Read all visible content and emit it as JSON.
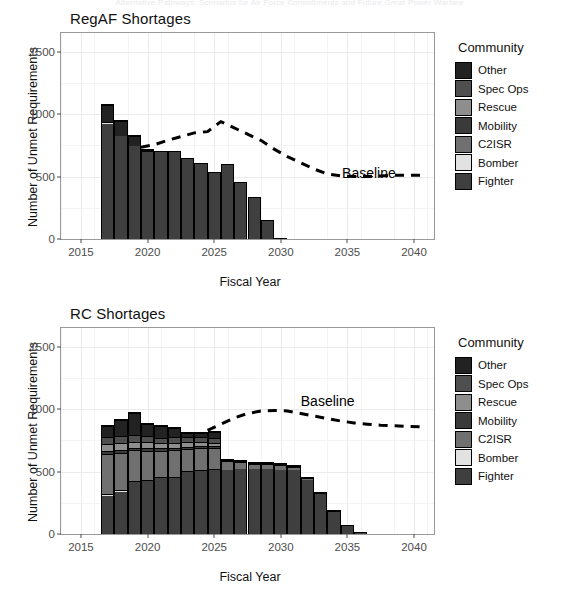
{
  "page": {
    "cut_header_text": "Alternative Pathways: Scenarios for Air Force Commitments and Future Great Power Warfare"
  },
  "legend": {
    "title": "Community",
    "items": [
      {
        "label": "Other",
        "color": "#222222"
      },
      {
        "label": "Spec Ops",
        "color": "#4f4f4f"
      },
      {
        "label": "Rescue",
        "color": "#8e8e8e"
      },
      {
        "label": "Mobility",
        "color": "#3a3a3a"
      },
      {
        "label": "C2ISR",
        "color": "#707070"
      },
      {
        "label": "Bomber",
        "color": "#e2e2e2"
      },
      {
        "label": "Fighter",
        "color": "#3f3f3f"
      }
    ]
  },
  "axes": {
    "ylabel": "Number of Unmet Requirements",
    "xlabel": "Fiscal Year",
    "yticks": [
      0,
      500,
      1000,
      1500
    ],
    "xticks": [
      2015,
      2020,
      2025,
      2030,
      2035,
      2040
    ],
    "ylim": [
      0,
      1650
    ],
    "xlim": [
      2013.5,
      2041.5
    ]
  },
  "chart_data": [
    {
      "type": "bar",
      "id": "regaf",
      "title": "RegAF Shortages",
      "xlabel": "Fiscal Year",
      "ylabel": "Number of Unmet Requirements",
      "ylim": [
        0,
        1650
      ],
      "xlim": [
        2013.5,
        2041.5
      ],
      "grid": true,
      "stacked": true,
      "legend_position": "right",
      "categories": [
        2017,
        2018,
        2019,
        2020,
        2021,
        2022,
        2023,
        2024,
        2025,
        2026,
        2027,
        2028,
        2029,
        2030
      ],
      "series": [
        {
          "name": "Fighter",
          "color": "#3f3f3f",
          "values": [
            930,
            830,
            750,
            715,
            705,
            705,
            645,
            610,
            535,
            600,
            455,
            340,
            150,
            10
          ]
        },
        {
          "name": "Bomber",
          "color": "#e2e2e2",
          "values": [
            15,
            0,
            0,
            0,
            0,
            0,
            0,
            0,
            0,
            0,
            0,
            0,
            0,
            0
          ]
        },
        {
          "name": "C2ISR",
          "color": "#707070",
          "values": [
            0,
            0,
            0,
            5,
            0,
            0,
            0,
            0,
            0,
            0,
            0,
            0,
            0,
            0
          ]
        },
        {
          "name": "Mobility",
          "color": "#3a3a3a",
          "values": [
            0,
            0,
            0,
            0,
            0,
            0,
            0,
            0,
            0,
            0,
            0,
            0,
            0,
            0
          ]
        },
        {
          "name": "Rescue",
          "color": "#8e8e8e",
          "values": [
            0,
            0,
            0,
            0,
            0,
            0,
            0,
            0,
            0,
            0,
            0,
            0,
            0,
            0
          ]
        },
        {
          "name": "Spec Ops",
          "color": "#4f4f4f",
          "values": [
            0,
            0,
            0,
            0,
            0,
            0,
            0,
            0,
            0,
            0,
            0,
            0,
            0,
            0
          ]
        },
        {
          "name": "Other",
          "color": "#222222",
          "values": [
            135,
            125,
            80,
            5,
            0,
            0,
            0,
            0,
            0,
            0,
            0,
            0,
            0,
            0
          ]
        }
      ],
      "totals": [
        1080,
        955,
        830,
        725,
        705,
        705,
        645,
        610,
        535,
        600,
        455,
        340,
        150,
        10
      ],
      "annotation": {
        "label": "Baseline",
        "x": 2034.6,
        "y": 520
      },
      "baseline": {
        "name": "Baseline",
        "style": "dashed",
        "color": "#000000",
        "x": [
          2019.5,
          2020.5,
          2021.5,
          2022.5,
          2023.5,
          2024.5,
          2025.5,
          2026.5,
          2027.5,
          2028.5,
          2029.5,
          2030.5,
          2031.5,
          2032.5,
          2033.5,
          2034.5,
          2035.5,
          2036.5,
          2037.5,
          2038.5,
          2039.5,
          2040.5
        ],
        "y": [
          735,
          755,
          790,
          820,
          850,
          860,
          940,
          890,
          840,
          790,
          720,
          660,
          610,
          560,
          520,
          505,
          500,
          500,
          505,
          510,
          510,
          510
        ]
      }
    },
    {
      "type": "bar",
      "id": "rc",
      "title": "RC Shortages",
      "xlabel": "Fiscal Year",
      "ylabel": "Number of Unmet Requirements",
      "ylim": [
        0,
        1650
      ],
      "xlim": [
        2013.5,
        2041.5
      ],
      "grid": true,
      "stacked": true,
      "legend_position": "right",
      "categories": [
        2017,
        2018,
        2019,
        2020,
        2021,
        2022,
        2023,
        2024,
        2025,
        2026,
        2027,
        2028,
        2029,
        2030,
        2031,
        2032,
        2033,
        2034,
        2035,
        2036
      ],
      "series": [
        {
          "name": "Fighter",
          "color": "#3f3f3f",
          "values": [
            310,
            340,
            420,
            430,
            450,
            455,
            500,
            510,
            520,
            525,
            530,
            530,
            530,
            525,
            520,
            440,
            330,
            190,
            70,
            20
          ]
        },
        {
          "name": "Bomber",
          "color": "#e2e2e2",
          "values": [
            15,
            12,
            10,
            10,
            10,
            10,
            8,
            8,
            8,
            0,
            0,
            0,
            0,
            0,
            0,
            0,
            0,
            0,
            0,
            0
          ]
        },
        {
          "name": "C2ISR",
          "color": "#707070",
          "values": [
            320,
            300,
            245,
            235,
            215,
            215,
            180,
            175,
            165,
            70,
            55,
            45,
            40,
            35,
            30,
            20,
            10,
            5,
            0,
            0
          ]
        },
        {
          "name": "Mobility",
          "color": "#3a3a3a",
          "values": [
            25,
            25,
            20,
            20,
            20,
            18,
            18,
            18,
            15,
            5,
            5,
            5,
            5,
            5,
            5,
            0,
            0,
            0,
            0,
            0
          ]
        },
        {
          "name": "Rescue",
          "color": "#8e8e8e",
          "values": [
            55,
            55,
            50,
            45,
            40,
            40,
            35,
            35,
            30,
            0,
            0,
            0,
            0,
            0,
            0,
            0,
            0,
            0,
            0,
            0
          ]
        },
        {
          "name": "Spec Ops",
          "color": "#4f4f4f",
          "values": [
            60,
            60,
            55,
            50,
            45,
            45,
            40,
            40,
            35,
            0,
            0,
            0,
            0,
            0,
            0,
            0,
            0,
            0,
            0,
            0
          ]
        },
        {
          "name": "Other",
          "color": "#222222",
          "values": [
            85,
            128,
            175,
            100,
            90,
            72,
            34,
            29,
            52,
            0,
            0,
            0,
            0,
            0,
            0,
            0,
            0,
            0,
            0,
            0
          ]
        }
      ],
      "totals": [
        870,
        920,
        975,
        890,
        870,
        855,
        815,
        815,
        825,
        600,
        590,
        580,
        575,
        565,
        555,
        460,
        340,
        195,
        70,
        20
      ],
      "annotation": {
        "label": "Baseline",
        "x": 2031.5,
        "y": 1060
      },
      "baseline": {
        "name": "Baseline",
        "style": "dashed",
        "color": "#000000",
        "x": [
          2024.5,
          2025.5,
          2026.5,
          2027.5,
          2028.5,
          2029.5,
          2030.5,
          2031.5,
          2032.5,
          2033.5,
          2034.5,
          2035.5,
          2036.5,
          2037.5,
          2038.5,
          2039.5,
          2040.5
        ],
        "y": [
          830,
          880,
          930,
          965,
          985,
          990,
          985,
          965,
          945,
          925,
          905,
          890,
          880,
          872,
          868,
          862,
          858
        ]
      }
    }
  ]
}
